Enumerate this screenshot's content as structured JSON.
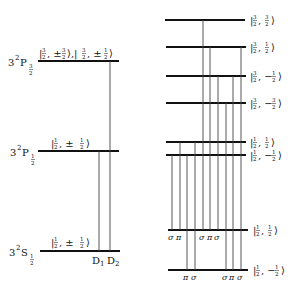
{
  "diagram": {
    "left": {
      "levels": [
        {
          "term": "3²P",
          "j_sub": "3/2",
          "state": "|3/2, ±3/2⟩, |3/2, ±1/2⟩",
          "y": 61
        },
        {
          "term": "3²P",
          "j_sub": "1/2",
          "state": "|1/2, ±1/2⟩",
          "y": 151
        },
        {
          "term": "3²S",
          "j_sub": "1/2",
          "state": "|1/2, ±1/2⟩",
          "y": 251
        }
      ],
      "transitions": [
        {
          "label": "D₁",
          "from": "3²P1/2",
          "to": "3²S1/2"
        },
        {
          "label": "D₂",
          "from": "3²P3/2",
          "to": "3²S1/2"
        }
      ],
      "transition_labels": [
        "D",
        "1",
        "D",
        "2"
      ]
    },
    "right": {
      "levels": [
        {
          "state": "|3/2, 3/2⟩",
          "j": "3",
          "m": "3",
          "sign": "",
          "y": 20
        },
        {
          "state": "|3/2, 1/2⟩",
          "j": "3",
          "m": "1",
          "sign": "",
          "y": 47
        },
        {
          "state": "|3/2, −1/2⟩",
          "j": "3",
          "m": "1",
          "sign": "−",
          "y": 76
        },
        {
          "state": "|3/2, −3/2⟩",
          "j": "3",
          "m": "3",
          "sign": "−",
          "y": 103
        },
        {
          "state": "|1/2, 1/2⟩",
          "j": "1",
          "m": "1",
          "sign": "",
          "y": 142
        },
        {
          "state": "|1/2, −1/2⟩",
          "j": "1",
          "m": "1",
          "sign": "−",
          "y": 155
        },
        {
          "state": "|1/2, 1/2⟩",
          "j": "1",
          "m": "1",
          "sign": "",
          "y": 230
        },
        {
          "state": "|1/2, −1/2⟩",
          "j": "1",
          "m": "1",
          "sign": "−",
          "y": 270
        }
      ],
      "upper_polarization_labels": [
        "σ",
        "π",
        "σ",
        "π",
        "σ"
      ],
      "lower_polarization_labels": [
        "π",
        "σ",
        "σ",
        "π",
        "σ"
      ]
    }
  }
}
